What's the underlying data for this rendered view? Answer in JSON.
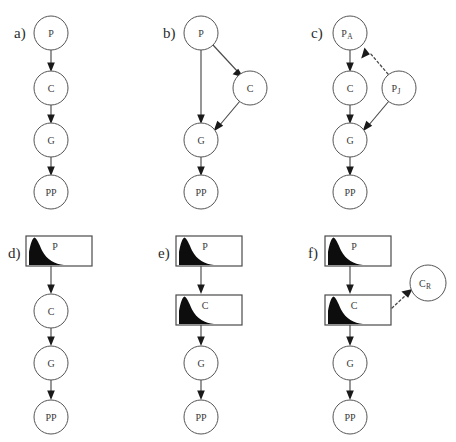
{
  "figure": {
    "width": 456,
    "height": 442,
    "background": "#ffffff",
    "stroke_color": "#4a4a4a",
    "node_fill": "#ffffff",
    "curve_fill": "#0d0d0d"
  },
  "panels": [
    {
      "id": "a",
      "label": "a)",
      "label_x": 14,
      "label_y": 38,
      "nodes": [
        {
          "id": "a-p",
          "name": "P",
          "shape": "circle",
          "cx": 51,
          "cy": 33,
          "r": 17,
          "label": "P",
          "sub": ""
        },
        {
          "id": "a-c",
          "name": "C",
          "shape": "circle",
          "cx": 51,
          "cy": 88,
          "r": 17,
          "label": "C",
          "sub": ""
        },
        {
          "id": "a-g",
          "name": "G",
          "shape": "circle",
          "cx": 51,
          "cy": 140,
          "r": 17,
          "label": "G",
          "sub": ""
        },
        {
          "id": "a-pp",
          "name": "PP",
          "shape": "circle",
          "cx": 51,
          "cy": 192,
          "r": 17,
          "label": "PP",
          "sub": ""
        }
      ],
      "edges": [
        {
          "from": "P",
          "to": "C",
          "style": "solid"
        },
        {
          "from": "C",
          "to": "G",
          "style": "solid"
        },
        {
          "from": "G",
          "to": "PP",
          "style": "solid"
        }
      ]
    },
    {
      "id": "b",
      "label": "b)",
      "label_x": 163,
      "label_y": 38,
      "nodes": [
        {
          "id": "b-p",
          "name": "P",
          "shape": "circle",
          "cx": 201,
          "cy": 33,
          "r": 17,
          "label": "P",
          "sub": ""
        },
        {
          "id": "b-c",
          "name": "C",
          "shape": "circle",
          "cx": 250,
          "cy": 88,
          "r": 17,
          "label": "C",
          "sub": ""
        },
        {
          "id": "b-g",
          "name": "G",
          "shape": "circle",
          "cx": 201,
          "cy": 140,
          "r": 17,
          "label": "G",
          "sub": ""
        },
        {
          "id": "b-pp",
          "name": "PP",
          "shape": "circle",
          "cx": 201,
          "cy": 192,
          "r": 17,
          "label": "PP",
          "sub": ""
        }
      ],
      "edges": [
        {
          "from": "P",
          "to": "C",
          "style": "solid"
        },
        {
          "from": "P",
          "to": "G",
          "style": "solid"
        },
        {
          "from": "C",
          "to": "G",
          "style": "solid"
        },
        {
          "from": "G",
          "to": "PP",
          "style": "solid"
        }
      ]
    },
    {
      "id": "c",
      "label": "c)",
      "label_x": 311,
      "label_y": 38,
      "nodes": [
        {
          "id": "c-pa",
          "name": "P_A",
          "shape": "circle",
          "cx": 350,
          "cy": 33,
          "r": 17,
          "label": "P",
          "sub": "A"
        },
        {
          "id": "c-c",
          "name": "C",
          "shape": "circle",
          "cx": 350,
          "cy": 88,
          "r": 17,
          "label": "C",
          "sub": ""
        },
        {
          "id": "c-pj",
          "name": "P_J",
          "shape": "circle",
          "cx": 399,
          "cy": 88,
          "r": 17,
          "label": "P",
          "sub": "J"
        },
        {
          "id": "c-g",
          "name": "G",
          "shape": "circle",
          "cx": 350,
          "cy": 140,
          "r": 17,
          "label": "G",
          "sub": ""
        },
        {
          "id": "c-pp",
          "name": "PP",
          "shape": "circle",
          "cx": 350,
          "cy": 192,
          "r": 17,
          "label": "PP",
          "sub": ""
        }
      ],
      "edges": [
        {
          "from": "P_A",
          "to": "C",
          "style": "solid"
        },
        {
          "from": "C",
          "to": "G",
          "style": "solid"
        },
        {
          "from": "G",
          "to": "PP",
          "style": "solid"
        },
        {
          "from": "P_J",
          "to": "P_A",
          "style": "dotted"
        },
        {
          "from": "P_J",
          "to": "G",
          "style": "solid"
        }
      ]
    },
    {
      "id": "d",
      "label": "d)",
      "label_x": 8,
      "label_y": 258,
      "nodes": [
        {
          "id": "d-p",
          "name": "P",
          "shape": "box",
          "x": 26,
          "y": 236,
          "w": 66,
          "h": 30,
          "label": "P",
          "sub": ""
        },
        {
          "id": "d-c",
          "name": "C",
          "shape": "circle",
          "cx": 51,
          "cy": 311,
          "r": 17,
          "label": "C",
          "sub": ""
        },
        {
          "id": "d-g",
          "name": "G",
          "shape": "circle",
          "cx": 51,
          "cy": 363,
          "r": 17,
          "label": "G",
          "sub": ""
        },
        {
          "id": "d-pp",
          "name": "PP",
          "shape": "circle",
          "cx": 51,
          "cy": 417,
          "r": 17,
          "label": "PP",
          "sub": ""
        }
      ],
      "edges": [
        {
          "from": "P",
          "to": "C",
          "style": "solid"
        },
        {
          "from": "C",
          "to": "G",
          "style": "solid"
        },
        {
          "from": "G",
          "to": "PP",
          "style": "solid"
        }
      ]
    },
    {
      "id": "e",
      "label": "e)",
      "label_x": 158,
      "label_y": 258,
      "nodes": [
        {
          "id": "e-p",
          "name": "P",
          "shape": "box",
          "x": 176,
          "y": 236,
          "w": 66,
          "h": 30,
          "label": "P",
          "sub": ""
        },
        {
          "id": "e-c",
          "name": "C",
          "shape": "box",
          "x": 176,
          "y": 295,
          "w": 66,
          "h": 30,
          "label": "C",
          "sub": ""
        },
        {
          "id": "e-g",
          "name": "G",
          "shape": "circle",
          "cx": 201,
          "cy": 363,
          "r": 17,
          "label": "G",
          "sub": ""
        },
        {
          "id": "e-pp",
          "name": "PP",
          "shape": "circle",
          "cx": 201,
          "cy": 417,
          "r": 17,
          "label": "PP",
          "sub": ""
        }
      ],
      "edges": [
        {
          "from": "P",
          "to": "C",
          "style": "solid"
        },
        {
          "from": "C",
          "to": "G",
          "style": "solid"
        },
        {
          "from": "G",
          "to": "PP",
          "style": "solid"
        }
      ]
    },
    {
      "id": "f",
      "label": "f)",
      "label_x": 308,
      "label_y": 258,
      "nodes": [
        {
          "id": "f-p",
          "name": "P",
          "shape": "box",
          "x": 325,
          "y": 236,
          "w": 66,
          "h": 30,
          "label": "P",
          "sub": ""
        },
        {
          "id": "f-c",
          "name": "C",
          "shape": "box",
          "x": 325,
          "y": 295,
          "w": 66,
          "h": 30,
          "label": "C",
          "sub": ""
        },
        {
          "id": "f-cr",
          "name": "C_R",
          "shape": "circle",
          "cx": 428,
          "cy": 283,
          "r": 18,
          "label": "C",
          "sub": "R"
        },
        {
          "id": "f-g",
          "name": "G",
          "shape": "circle",
          "cx": 350,
          "cy": 363,
          "r": 17,
          "label": "G",
          "sub": ""
        },
        {
          "id": "f-pp",
          "name": "PP",
          "shape": "circle",
          "cx": 350,
          "cy": 417,
          "r": 17,
          "label": "PP",
          "sub": ""
        }
      ],
      "edges": [
        {
          "from": "P",
          "to": "C",
          "style": "solid"
        },
        {
          "from": "C",
          "to": "G",
          "style": "solid"
        },
        {
          "from": "G",
          "to": "PP",
          "style": "solid"
        },
        {
          "from": "C",
          "to": "C_R",
          "style": "dotted"
        }
      ]
    }
  ]
}
